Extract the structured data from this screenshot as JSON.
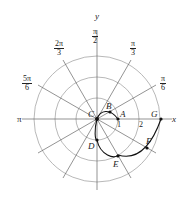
{
  "diagram": {
    "type": "polar-graph",
    "axes": {
      "x_label": "x",
      "y_label": "y"
    },
    "angle_labels": [
      {
        "num": "π",
        "den": "2",
        "angle": "π/2"
      },
      {
        "num": "π",
        "den": "3",
        "angle": "π/3"
      },
      {
        "num": "π",
        "den": "6",
        "angle": "π/6"
      },
      {
        "num": "2π",
        "den": "3",
        "angle": "2π/3"
      },
      {
        "num": "5π",
        "den": "6",
        "angle": "5π/6"
      },
      {
        "num": "π",
        "den": "",
        "angle": "π"
      }
    ],
    "radial_ticks": [
      "1",
      "2"
    ],
    "points": [
      "A",
      "B",
      "C",
      "D",
      "E",
      "F",
      "G"
    ]
  }
}
